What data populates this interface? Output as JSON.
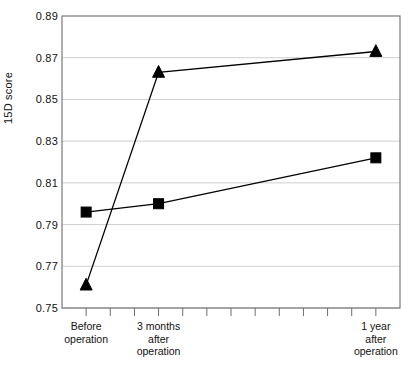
{
  "chart_data": {
    "type": "line",
    "title": "",
    "xlabel": "",
    "ylabel": "15D score",
    "ylim": [
      0.75,
      0.89
    ],
    "ytick_labels": [
      "0.89",
      "0.87",
      "0.85",
      "0.83",
      "0.81",
      "0.79",
      "0.77",
      "0.75"
    ],
    "ytick_values": [
      0.89,
      0.87,
      0.85,
      0.83,
      0.81,
      0.79,
      0.77,
      0.75
    ],
    "grid": true,
    "legend": "none",
    "categories": [
      "Before\noperation",
      "3 months\nafter\noperation",
      "1 year\nafter\noperation"
    ],
    "category_x_index": [
      1,
      4,
      13
    ],
    "x_tick_count": 14,
    "series": [
      {
        "name": "triangle-series",
        "marker": "triangle",
        "color": "#000000",
        "values": [
          0.761,
          0.863,
          0.873
        ]
      },
      {
        "name": "square-series",
        "marker": "square",
        "color": "#000000",
        "values": [
          0.796,
          0.8,
          0.822
        ]
      }
    ]
  }
}
